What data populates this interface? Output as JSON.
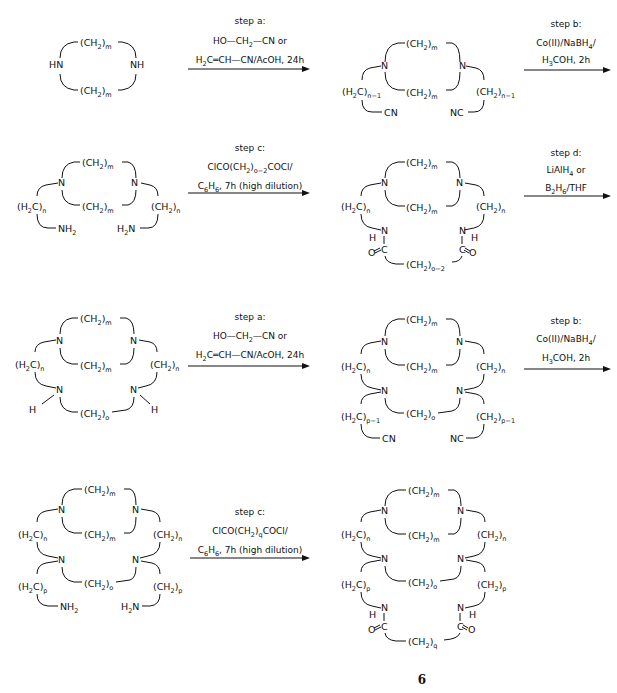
{
  "scheme": {
    "compound_label": "6",
    "rows": [
      {
        "reactant": {
          "name": "macrocycle-diamine",
          "top": "(CH2)m",
          "bottom": "(CH2)m",
          "left_n": "HN",
          "right_n": "NH"
        },
        "step1": {
          "title": "step a:",
          "line1": "HO—CH2—CN or",
          "line2": "H2C═CH—CN/AcOH, 24h"
        },
        "product": {
          "name": "bis-nitrile",
          "top": "(CH2)m",
          "bottom": "(CH2)m",
          "left_arm": "(H2C)n−1",
          "right_arm": "(CH2)n−1",
          "left_end": "CN",
          "right_end": "NC"
        },
        "step2": {
          "title": "step b:",
          "line1": "Co(II)/NaBH4/",
          "line2": "H3COH, 2h"
        }
      },
      {
        "reactant": {
          "name": "bis-amine",
          "top": "(CH2)m",
          "bottom": "(CH2)m",
          "left_arm": "(H2C)n",
          "right_arm": "(CH2)n",
          "left_end": "NH2",
          "right_end": "H2N"
        },
        "step1": {
          "title": "step c:",
          "line1": "ClCO(CH2)o−2COCl/",
          "line2": "C6H6, 7h (high dilution)"
        },
        "product": {
          "name": "bis-amide",
          "top": "(CH2)m",
          "bottom": "(CH2)m",
          "left_arm": "(H2C)n",
          "right_arm": "(CH2)n",
          "bridge": "(CH2)o−2"
        },
        "step2": {
          "title": "step d:",
          "line1": "LiAlH4 or",
          "line2": "B2H6/THF"
        }
      },
      {
        "reactant": {
          "name": "bicyclic-diamine",
          "top": "(CH2)m",
          "bottom": "(CH2)m",
          "left_arm": "(H2C)n",
          "right_arm": "(CH2)n",
          "bridge": "(CH2)o"
        },
        "step1": {
          "title": "step a:",
          "line1": "HO—CH2—CN or",
          "line2": "H2C═CH—CN/AcOH, 24h"
        },
        "product": {
          "name": "bicyclic-bis-nitrile",
          "top": "(CH2)m",
          "bottom": "(CH2)m",
          "left_arm": "(H2C)n",
          "right_arm": "(CH2)n",
          "bridge": "(CH2)o",
          "left_arm2": "(H2C)p−1",
          "right_arm2": "(CH2)p−1",
          "left_end": "CN",
          "right_end": "NC"
        },
        "step2": {
          "title": "step b:",
          "line1": "Co(II)/NaBH4/",
          "line2": "H3COH, 2h"
        }
      },
      {
        "reactant": {
          "name": "bicyclic-bis-amine",
          "top": "(CH2)m",
          "bottom": "(CH2)m",
          "left_arm": "(H2C)n",
          "right_arm": "(CH2)n",
          "bridge": "(CH2)o",
          "left_arm2": "(H2C)p",
          "right_arm2": "(CH2)p",
          "left_end": "NH2",
          "right_end": "H2N"
        },
        "step1": {
          "title": "step c:",
          "line1": "ClCO(CH2)qCOCl/",
          "line2": "C6H6, 7h (high dilution)"
        },
        "product": {
          "name": "tricyclic-bis-amide-6",
          "top": "(CH2)m",
          "bottom": "(CH2)m",
          "left_arm": "(H2C)n",
          "right_arm": "(CH2)n",
          "bridge": "(CH2)o",
          "left_arm2": "(H2C)p",
          "right_arm2": "(CH2)p",
          "bridge2": "(CH2)q"
        }
      }
    ]
  }
}
